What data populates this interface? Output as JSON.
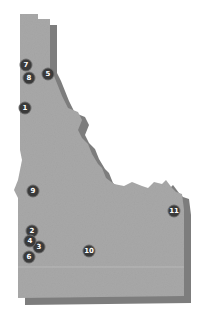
{
  "map": {
    "region": "Idaho",
    "colors": {
      "land": "#a8a8a8",
      "shadow": "#7d7d7d",
      "marker": "#3a3a3a",
      "marker_text": "#ffffff",
      "background": "#ffffff"
    },
    "markers": [
      {
        "label": "1",
        "x": 25,
        "y": 108
      },
      {
        "label": "2",
        "x": 32,
        "y": 231
      },
      {
        "label": "3",
        "x": 39,
        "y": 247
      },
      {
        "label": "4",
        "x": 30,
        "y": 241
      },
      {
        "label": "5",
        "x": 48,
        "y": 74
      },
      {
        "label": "6",
        "x": 29,
        "y": 257
      },
      {
        "label": "7",
        "x": 26,
        "y": 65
      },
      {
        "label": "8",
        "x": 29,
        "y": 78
      },
      {
        "label": "9",
        "x": 33,
        "y": 191
      },
      {
        "label": "10",
        "x": 89,
        "y": 251
      },
      {
        "label": "11",
        "x": 174,
        "y": 211
      }
    ]
  }
}
